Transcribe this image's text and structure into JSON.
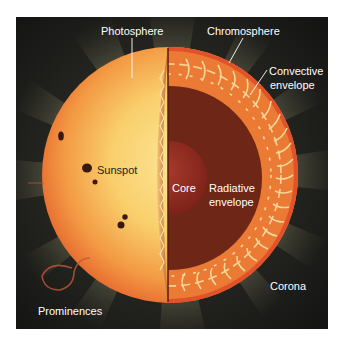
{
  "diagram": {
    "colors": {
      "background": "#1c1c1a",
      "corona_ray": "#a8a67a",
      "photosphere_center": "#fbe08a",
      "photosphere_edge": "#e8652c",
      "chromosphere": "#e2512a",
      "convective_envelope": "#ea7a34",
      "convection_cells": "#f6d79a",
      "radiative_envelope": "#6e2616",
      "core": "#8c2a20",
      "sunspot": "#3a1810",
      "label_text": "#ffffff",
      "sunspot_label_text": "#222222"
    },
    "labels": {
      "photosphere": "Photosphere",
      "chromosphere": "Chromosphere",
      "convective_line1": "Convective",
      "convective_line2": "envelope",
      "sunspot": "Sunspot",
      "core": "Core",
      "radiative_line1": "Radiative",
      "radiative_line2": "envelope",
      "corona": "Corona",
      "prominences": "Prominences"
    }
  }
}
